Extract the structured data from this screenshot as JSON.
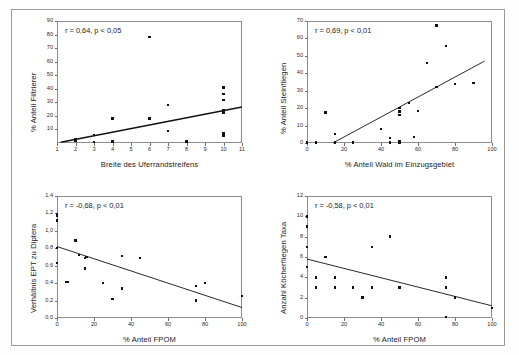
{
  "figure": {
    "title": "",
    "background_color": "#ffffff",
    "frame_color": "#9a9a9a",
    "point_color": "#111111",
    "line_color": "#111111",
    "panel_count": 4
  },
  "chart_data": [
    {
      "id": "panel-top-left",
      "type": "scatter",
      "title": "",
      "annotation": "r = 0,64, p < 0,05",
      "r": 0.64,
      "p_text": "p < 0,05",
      "xlabel": "Breite des Uferrandstreifens",
      "ylabel": "% Anteil Filtrierer",
      "xlim": [
        1,
        11
      ],
      "ylim": [
        0,
        90
      ],
      "xticks": [
        1,
        2,
        3,
        4,
        5,
        6,
        7,
        8,
        9,
        10,
        11
      ],
      "xticklabels": [
        "1",
        "2",
        "3",
        "4",
        "5",
        "6",
        "7",
        "8",
        "9",
        "10",
        "11"
      ],
      "yticks": [
        10,
        20,
        30,
        40,
        50,
        60,
        70,
        80,
        90
      ],
      "yticklabels": [
        "10",
        "20",
        "30",
        "40",
        "50",
        "60",
        "70",
        "80",
        "90"
      ],
      "grid": false,
      "legend": "none",
      "points": [
        {
          "x": 2,
          "y": 1.5
        },
        {
          "x": 2,
          "y": 2.5
        },
        {
          "x": 3,
          "y": 0.8
        },
        {
          "x": 3,
          "y": 6.0
        },
        {
          "x": 4,
          "y": 1.0
        },
        {
          "x": 4,
          "y": 18.0
        },
        {
          "x": 6,
          "y": 18.0
        },
        {
          "x": 6,
          "y": 78.0
        },
        {
          "x": 7,
          "y": 9.0
        },
        {
          "x": 7,
          "y": 28.0
        },
        {
          "x": 8,
          "y": 1.0
        },
        {
          "x": 10,
          "y": 5.5
        },
        {
          "x": 10,
          "y": 7.5
        },
        {
          "x": 10,
          "y": 22.5
        },
        {
          "x": 10,
          "y": 24.0
        },
        {
          "x": 10,
          "y": 31.5
        },
        {
          "x": 10,
          "y": 36.0
        },
        {
          "x": 10,
          "y": 41.0
        }
      ],
      "trend": {
        "x1": 1.2,
        "y1": 0.5,
        "x2": 11.0,
        "y2": 26.5
      }
    },
    {
      "id": "panel-top-right",
      "type": "scatter",
      "title": "",
      "annotation": "r = 0,69, p < 0,01",
      "r": 0.69,
      "p_text": "p < 0,01",
      "xlabel": "% Anteil Wald im Einzugsgebiet",
      "ylabel": "% Anteil Steinfliegen",
      "xlim": [
        0,
        100
      ],
      "ylim": [
        0,
        70
      ],
      "xticks": [
        0,
        20,
        40,
        60,
        80,
        100
      ],
      "xticklabels": [
        "0",
        "20",
        "40",
        "60",
        "80",
        "100"
      ],
      "yticks": [
        0,
        10,
        20,
        30,
        40,
        50,
        60,
        70
      ],
      "yticklabels": [
        "0",
        "10",
        "20",
        "30",
        "40",
        "50",
        "60",
        "70"
      ],
      "grid": false,
      "legend": "none",
      "points": [
        {
          "x": 0,
          "y": 0.3
        },
        {
          "x": 5,
          "y": 0.3
        },
        {
          "x": 10,
          "y": 17.5
        },
        {
          "x": 15,
          "y": 0.3
        },
        {
          "x": 15,
          "y": 5.0
        },
        {
          "x": 25,
          "y": 0.3
        },
        {
          "x": 40,
          "y": 8.0
        },
        {
          "x": 45,
          "y": 3.0
        },
        {
          "x": 45,
          "y": 0.3
        },
        {
          "x": 50,
          "y": 0.3
        },
        {
          "x": 50,
          "y": 1.0
        },
        {
          "x": 50,
          "y": 16.0
        },
        {
          "x": 50,
          "y": 18.0
        },
        {
          "x": 50,
          "y": 20.0
        },
        {
          "x": 55,
          "y": 23.0
        },
        {
          "x": 58,
          "y": 3.5
        },
        {
          "x": 60,
          "y": 18.5
        },
        {
          "x": 65,
          "y": 46.0
        },
        {
          "x": 70,
          "y": 32.0
        },
        {
          "x": 70,
          "y": 67.5
        },
        {
          "x": 75,
          "y": 55.5
        },
        {
          "x": 80,
          "y": 34.0
        },
        {
          "x": 90,
          "y": 34.5
        }
      ],
      "trend": {
        "x1": 14.0,
        "y1": 0.0,
        "x2": 96.0,
        "y2": 47.0
      }
    },
    {
      "id": "panel-bottom-left",
      "type": "scatter",
      "title": "",
      "annotation": "r = -0,68, p < 0,01",
      "r": -0.68,
      "p_text": "p < 0,01",
      "xlabel": "% Anteil FPOM",
      "ylabel": "Verhältnis EPT zu Diptera",
      "xlim": [
        0,
        100
      ],
      "ylim": [
        0.0,
        1.4
      ],
      "xticks": [
        0,
        20,
        40,
        60,
        80,
        100
      ],
      "xticklabels": [
        "0",
        "20",
        "40",
        "60",
        "80",
        "100"
      ],
      "yticks": [
        0.0,
        0.2,
        0.4,
        0.6,
        0.8,
        1.0,
        1.2,
        1.4
      ],
      "yticklabels": [
        "0,0",
        "0,2",
        "0,4",
        "0,6",
        "0,8",
        "1,0",
        "1,2",
        "1,4"
      ],
      "grid": false,
      "legend": "none",
      "points": [
        {
          "x": 0,
          "y": 1.19
        },
        {
          "x": 0,
          "y": 1.17
        },
        {
          "x": 0,
          "y": 1.12
        },
        {
          "x": 0,
          "y": 0.8
        },
        {
          "x": 0,
          "y": 0.63
        },
        {
          "x": 5,
          "y": 0.41
        },
        {
          "x": 6,
          "y": 0.41
        },
        {
          "x": 10,
          "y": 0.89
        },
        {
          "x": 12,
          "y": 0.72
        },
        {
          "x": 15,
          "y": 0.69
        },
        {
          "x": 16,
          "y": 0.7
        },
        {
          "x": 15,
          "y": 0.57
        },
        {
          "x": 25,
          "y": 0.4
        },
        {
          "x": 30,
          "y": 0.22
        },
        {
          "x": 35,
          "y": 0.71
        },
        {
          "x": 35,
          "y": 0.34
        },
        {
          "x": 45,
          "y": 0.69
        },
        {
          "x": 75,
          "y": 0.37
        },
        {
          "x": 75,
          "y": 0.2
        },
        {
          "x": 80,
          "y": 0.4
        },
        {
          "x": 100,
          "y": 0.25
        }
      ],
      "trend": {
        "x1": 0.0,
        "y1": 0.82,
        "x2": 100.0,
        "y2": 0.12
      }
    },
    {
      "id": "panel-bottom-right",
      "type": "scatter",
      "title": "",
      "annotation": "r = -0,58, p < 0,01",
      "r": -0.58,
      "p_text": "p < 0,01",
      "xlabel": "% Anteil FPOM",
      "ylabel": "Anzahl Köcherfliegen Taxa",
      "xlim": [
        0,
        100
      ],
      "ylim": [
        0,
        12
      ],
      "xticks": [
        0,
        20,
        40,
        60,
        80,
        100
      ],
      "xticklabels": [
        "0",
        "20",
        "40",
        "60",
        "80",
        "100"
      ],
      "yticks": [
        0,
        2,
        4,
        6,
        8,
        10,
        12
      ],
      "yticklabels": [
        "0",
        "2",
        "4",
        "6",
        "8",
        "10",
        "12"
      ],
      "grid": false,
      "legend": "none",
      "points": [
        {
          "x": 0,
          "y": 10
        },
        {
          "x": 0,
          "y": 9
        },
        {
          "x": 0,
          "y": 7
        },
        {
          "x": 0,
          "y": 5
        },
        {
          "x": 5,
          "y": 4
        },
        {
          "x": 5,
          "y": 3
        },
        {
          "x": 10,
          "y": 6
        },
        {
          "x": 15,
          "y": 4
        },
        {
          "x": 15,
          "y": 3
        },
        {
          "x": 25,
          "y": 3
        },
        {
          "x": 30,
          "y": 2
        },
        {
          "x": 35,
          "y": 3
        },
        {
          "x": 35,
          "y": 7
        },
        {
          "x": 45,
          "y": 8
        },
        {
          "x": 50,
          "y": 3
        },
        {
          "x": 75,
          "y": 4
        },
        {
          "x": 75,
          "y": 3
        },
        {
          "x": 75,
          "y": 0.1
        },
        {
          "x": 80,
          "y": 2
        },
        {
          "x": 100,
          "y": 1
        }
      ],
      "trend": {
        "x1": 0.0,
        "y1": 5.8,
        "x2": 100.0,
        "y2": 1.2
      }
    }
  ]
}
